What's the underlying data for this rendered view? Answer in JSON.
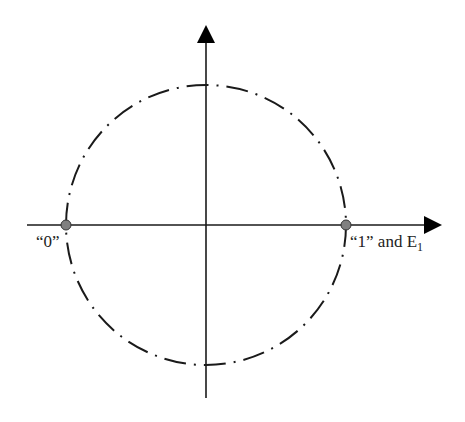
{
  "diagram": {
    "type": "unit-circle-state",
    "labels": {
      "left_point": "“0”",
      "right_point": "“1” and E",
      "right_point_subscript": "1"
    },
    "colors": {
      "axis": "#1a1a1a",
      "circle": "#1a1a1a",
      "point_fill": "#808080"
    }
  }
}
